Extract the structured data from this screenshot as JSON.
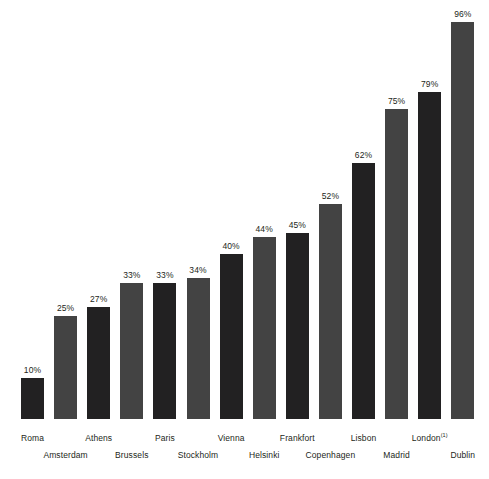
{
  "chart_data": {
    "type": "bar",
    "title": "",
    "subtitle": "",
    "xlabel": "",
    "ylabel": "",
    "ylim": [
      0,
      100
    ],
    "grid": false,
    "legend": null,
    "value_suffix": "%",
    "categories": [
      "Roma",
      "Amsterdam",
      "Athens",
      "Brussels",
      "Paris",
      "Stockholm",
      "Vienna",
      "Helsinki",
      "Frankfort",
      "Copenhagen",
      "Lisbon",
      "Madrid",
      "London",
      "Dublin"
    ],
    "values": [
      10,
      25,
      27,
      33,
      33,
      34,
      40,
      44,
      45,
      52,
      62,
      75,
      79,
      96
    ],
    "value_labels": [
      "10%",
      "25%",
      "27%",
      "33%",
      "33%",
      "34%",
      "40%",
      "44%",
      "45%",
      "52%",
      "62%",
      "75%",
      "79%",
      "96%"
    ],
    "annotations": [
      {
        "category": "London",
        "marker": "(1)",
        "note": "footnote marker on London label"
      }
    ],
    "colors": {
      "bar_dark": "#222122",
      "bar_light": "#434343",
      "background": "#ffffff",
      "text": "#231f20"
    }
  },
  "bars": [
    {
      "label": "Roma",
      "value_label": "10%",
      "shade": "shade-dark",
      "row": "row-top"
    },
    {
      "label": "Amsterdam",
      "value_label": "25%",
      "shade": "shade-light",
      "row": "row-bottom"
    },
    {
      "label": "Athens",
      "value_label": "27%",
      "shade": "shade-dark",
      "row": "row-top"
    },
    {
      "label": "Brussels",
      "value_label": "33%",
      "shade": "shade-light",
      "row": "row-bottom"
    },
    {
      "label": "Paris",
      "value_label": "33%",
      "shade": "shade-dark",
      "row": "row-top"
    },
    {
      "label": "Stockholm",
      "value_label": "34%",
      "shade": "shade-light",
      "row": "row-bottom"
    },
    {
      "label": "Vienna",
      "value_label": "40%",
      "shade": "shade-dark",
      "row": "row-top"
    },
    {
      "label": "Helsinki",
      "value_label": "44%",
      "shade": "shade-light",
      "row": "row-bottom"
    },
    {
      "label": "Frankfort",
      "value_label": "45%",
      "shade": "shade-dark",
      "row": "row-top"
    },
    {
      "label": "Copenhagen",
      "value_label": "52%",
      "shade": "shade-light",
      "row": "row-bottom"
    },
    {
      "label": "Lisbon",
      "value_label": "62%",
      "shade": "shade-dark",
      "row": "row-top"
    },
    {
      "label": "Madrid",
      "value_label": "75%",
      "shade": "shade-light",
      "row": "row-bottom"
    },
    {
      "label": "London",
      "value_label": "79%",
      "shade": "shade-dark",
      "row": "row-top",
      "sup": "(1)"
    },
    {
      "label": "Dublin",
      "value_label": "96%",
      "shade": "shade-light",
      "row": "row-bottom"
    }
  ]
}
